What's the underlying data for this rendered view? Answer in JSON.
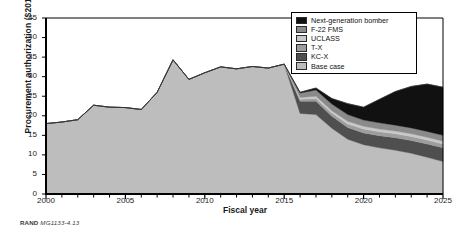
{
  "figure": {
    "credit_prefix": "RAND",
    "credit_id": "MG1133-4.13"
  },
  "chart_data": {
    "type": "area",
    "stacked": true,
    "title": "",
    "xlabel": "Fiscal year",
    "ylabel": "Procurement authorization ($2011B)",
    "xlim": [
      2000,
      2025
    ],
    "ylim": [
      0,
      45
    ],
    "ytick_values": [
      0,
      5,
      10,
      15,
      20,
      25,
      30,
      35,
      40,
      45
    ],
    "xtick_values": [
      2000,
      2005,
      2010,
      2015,
      2020,
      2025
    ],
    "xtick_labels": [
      "2000",
      "2005",
      "2010",
      "2015",
      "2020",
      "2025"
    ],
    "x_minor_tick_interval": 1,
    "grid": false,
    "legend_position": "top-right",
    "x": [
      2000,
      2001,
      2002,
      2003,
      2004,
      2005,
      2006,
      2007,
      2008,
      2009,
      2010,
      2011,
      2012,
      2013,
      2014,
      2015,
      2016,
      2017,
      2018,
      2019,
      2020,
      2021,
      2022,
      2023,
      2024,
      2025
    ],
    "series": [
      {
        "name": "Base case",
        "color": "#bdbdbd",
        "values": [
          18.0,
          18.4,
          19.0,
          22.7,
          22.2,
          22.1,
          21.6,
          26.0,
          34.3,
          29.3,
          31.0,
          32.5,
          32.0,
          32.6,
          32.2,
          33.2,
          20.6,
          20.3,
          16.8,
          14.0,
          12.6,
          11.8,
          11.2,
          10.4,
          9.4,
          8.3
        ]
      },
      {
        "name": "KC-X",
        "color": "#4f4f4f",
        "values": [
          0,
          0,
          0,
          0,
          0,
          0,
          0,
          0,
          0,
          0,
          0,
          0,
          0,
          0,
          0,
          0,
          3.1,
          3.4,
          3.1,
          3.0,
          3.0,
          3.1,
          3.2,
          3.3,
          3.4,
          3.5
        ]
      },
      {
        "name": "T-X",
        "color": "#9d9d9d",
        "values": [
          0,
          0,
          0,
          0,
          0,
          0,
          0,
          0,
          0,
          0,
          0,
          0,
          0,
          0,
          0,
          0,
          0.5,
          0.7,
          0.8,
          0.9,
          1.0,
          1.0,
          1.0,
          1.0,
          1.0,
          1.0
        ]
      },
      {
        "name": "UCLASS",
        "color": "#c8c8c8",
        "values": [
          0,
          0,
          0,
          0,
          0,
          0,
          0,
          0,
          0,
          0,
          0,
          0,
          0,
          0,
          0,
          0,
          0.5,
          0.6,
          0.6,
          0.7,
          0.7,
          0.7,
          0.7,
          0.7,
          0.7,
          0.7
        ]
      },
      {
        "name": "F-22 FMS",
        "color": "#8a8a8a",
        "values": [
          0,
          0,
          0,
          0,
          0,
          0,
          0,
          0,
          0,
          0,
          0,
          0,
          0,
          0,
          0,
          0,
          1.1,
          1.6,
          1.7,
          1.7,
          1.6,
          1.6,
          1.5,
          1.5,
          1.5,
          1.5
        ]
      },
      {
        "name": "Next-generation bomber",
        "color": "#111111",
        "values": [
          0,
          0,
          0,
          0,
          0,
          0,
          0,
          0,
          0,
          0,
          0,
          0,
          0,
          0,
          0,
          0,
          0.2,
          0.5,
          1.4,
          2.8,
          3.3,
          6.0,
          8.6,
          10.6,
          12.1,
          12.3
        ]
      }
    ],
    "legend": [
      {
        "label": "Next-generation bomber",
        "color": "#111111"
      },
      {
        "label": "F-22 FMS",
        "color": "#8a8a8a"
      },
      {
        "label": "UCLASS",
        "color": "#c8c8c8"
      },
      {
        "label": "T-X",
        "color": "#9d9d9d"
      },
      {
        "label": "KC-X",
        "color": "#4f4f4f"
      },
      {
        "label": "Base case",
        "color": "#bdbdbd"
      }
    ]
  }
}
